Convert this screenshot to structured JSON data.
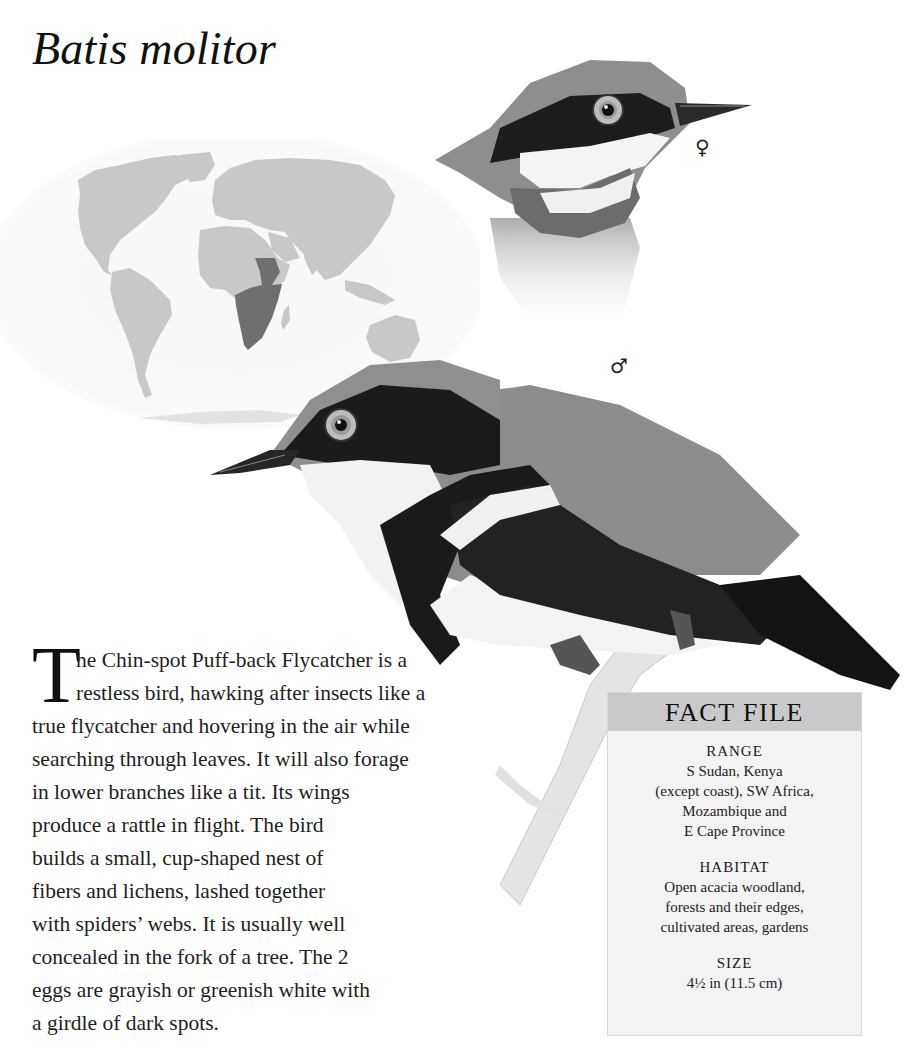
{
  "title": "Batis molitor",
  "map": {
    "label": "world-range-map",
    "highlighted_region": "Sub-Saharan Africa (S Sudan, Kenya to E Cape Province)",
    "colors": {
      "ocean": "#fafafa",
      "land": "#c8c8c8",
      "range": "#6f6f6f"
    }
  },
  "illustrations": {
    "female": {
      "symbol": "♀"
    },
    "male": {
      "symbol": "♂"
    }
  },
  "body": {
    "drop_cap": "T",
    "lines": [
      "he Chin-spot Puff-back Flycatcher is a",
      "restless bird, hawking after insects like a",
      "true flycatcher and hovering in the air while",
      "searching through leaves. It will also forage",
      "in lower branches like a tit. Its wings",
      "produce a rattle in flight. The bird",
      "builds a small, cup-shaped nest of",
      "fibers and lichens, lashed together",
      "with spiders’ webs. It is usually well",
      "concealed in the fork of a tree. The 2",
      "eggs are grayish or greenish white with",
      "a girdle of dark spots."
    ]
  },
  "fact_file": {
    "header": "FACT FILE",
    "sections": [
      {
        "label": "RANGE",
        "lines": [
          "S Sudan, Kenya",
          "(except coast), SW Africa,",
          "Mozambique and",
          "E Cape Province"
        ]
      },
      {
        "label": "HABITAT",
        "lines": [
          "Open acacia woodland,",
          "forests and their edges,",
          "cultivated areas, gardens"
        ]
      },
      {
        "label": "SIZE",
        "lines": [
          "4½ in (11.5 cm)"
        ]
      }
    ]
  }
}
